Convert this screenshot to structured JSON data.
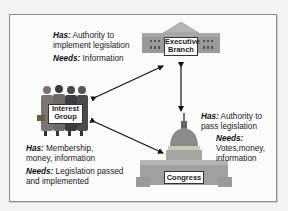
{
  "diagram": {
    "type": "relationship-triangle",
    "nodes": [
      {
        "id": "executive",
        "label_line1": "Executive",
        "label_line2": "Branch",
        "icon": "government-building-icon",
        "has_label": "Has:",
        "has_text_line1": "Authority to",
        "has_text_line2": "implement legislation",
        "needs_label": "Needs:",
        "needs_text": "Information"
      },
      {
        "id": "interest_group",
        "label_line1": "Interest",
        "label_line2": "Group",
        "icon": "people-group-icon",
        "has_label": "Has:",
        "has_text_line1": "Membership,",
        "has_text_line2": "money, information",
        "needs_label": "Needs:",
        "needs_text_line1": "Legislation passed",
        "needs_text_line2": "and implemented"
      },
      {
        "id": "congress",
        "label": "Congress",
        "icon": "capitol-building-icon",
        "has_label": "Has:",
        "has_text_line1": "Authority to",
        "has_text_line2": "pass legislation",
        "needs_label": "Needs:",
        "needs_text_line1": "Votes,money,",
        "needs_text_line2": "information"
      }
    ],
    "edges": [
      {
        "from": "interest_group",
        "to": "executive",
        "bidirectional": true
      },
      {
        "from": "executive",
        "to": "congress",
        "bidirectional": true
      },
      {
        "from": "interest_group",
        "to": "congress",
        "bidirectional": true
      }
    ],
    "colors": {
      "building": "#9a9a98",
      "roof": "#b4b4b2",
      "dome": "#8a8c8a",
      "dome_band": "#c9c9b0",
      "suits": "#6b6a66",
      "arrow": "#111111",
      "frame": "#8d8d8d"
    }
  }
}
